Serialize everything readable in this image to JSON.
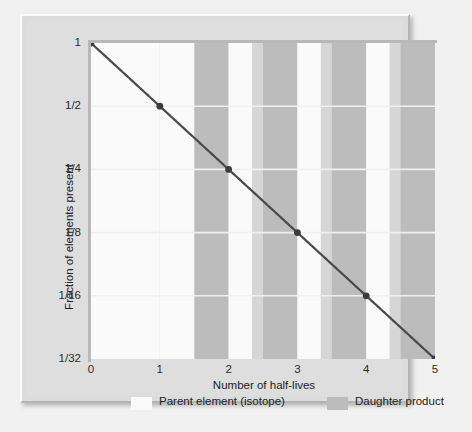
{
  "chart_data": {
    "type": "line",
    "title": "",
    "xlabel": "Number of half-lives",
    "ylabel": "Fraction of elements present",
    "x": [
      0,
      1,
      2,
      3,
      4,
      5
    ],
    "values": [
      1,
      0.5,
      0.25,
      0.125,
      0.0625,
      0.03125
    ],
    "y_tick_labels": [
      "1",
      "1/2",
      "1/4",
      "1/8",
      "1/16",
      "1/32"
    ],
    "y_tick_values": [
      1,
      0.5,
      0.25,
      0.125,
      0.0625,
      0.03125
    ],
    "x_tick_labels": [
      "0",
      "1",
      "2",
      "3",
      "4",
      "5"
    ],
    "xlim": [
      0,
      5
    ],
    "ylim": [
      0.03125,
      1
    ],
    "yscale": "log2",
    "grid": true,
    "legend_position": "bottom",
    "series": [
      {
        "name": "Fraction of parent element remaining",
        "values": [
          1,
          0.5,
          0.25,
          0.125,
          0.0625,
          0.03125
        ]
      }
    ],
    "legend": [
      {
        "label": "Parent element (isotope)",
        "color": "#fafafa",
        "key": "parent"
      },
      {
        "label": "Daughter product",
        "color": "#bcbcbc",
        "key": "daughter"
      }
    ],
    "annotations": [
      "Background vertical bands show the proportion of parent isotope (white) versus daughter product (gray) at each half-life."
    ]
  },
  "colors": {
    "page_background": "#f1f1f1",
    "panel_background": "#dedede",
    "plot_background": "#d9d9d9",
    "band_light": "#d6d6d6",
    "band_dark": "#bcbcbc",
    "parent_white": "#fafafa",
    "curve": "#4a4a4a",
    "marker": "#3c3c3c",
    "gridline": "#efefef",
    "axis_line": "#b8b8b8",
    "text": "#212121"
  },
  "axes": {
    "y_title": "Fraction of elements present",
    "x_title": "Number of half-lives"
  },
  "legend": {
    "parent_label": "Parent element (isotope)",
    "daughter_label": "Daughter product"
  }
}
